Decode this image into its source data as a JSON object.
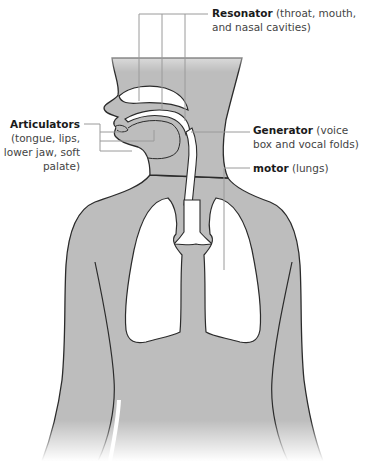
{
  "figure": {
    "colors": {
      "body_fill": "#bdbdbd",
      "outline": "#2b2b2b",
      "cavity_fill": "#ffffff",
      "leader_line": "#9a9a9a"
    }
  },
  "labels": {
    "resonator": {
      "term": "Resonator",
      "detail": "(throat, mouth, and nasal cavities)"
    },
    "articulators": {
      "term": "Articulators",
      "detail": "(tongue, lips, lower jaw, soft palate)"
    },
    "generator": {
      "term": "Generator",
      "detail": "(voice box and vocal folds)"
    },
    "motor": {
      "term": "motor",
      "detail": "(lungs)"
    }
  }
}
